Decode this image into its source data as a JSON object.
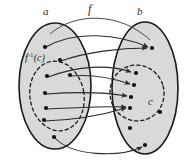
{
  "figure": {
    "type": "set-mapping-diagram",
    "background_color": "#ffffff",
    "set_fill_color": "#d9d9d9",
    "set_stroke_color": "#1a1a1a",
    "dashed_stroke_color": "#1a1a1a",
    "arrow_color": "#2b2b2b",
    "dot_color": "#111111"
  },
  "labels": {
    "domain_set": "a",
    "codomain_set": "b",
    "function": "f",
    "subset": "c",
    "preimage_base": "f",
    "preimage_exponent": "-1",
    "preimage_arg": "(c)"
  },
  "sets": {
    "domain": {
      "name": "a",
      "ellipse": {
        "cx": 55,
        "cy": 86,
        "rx": 36,
        "ry": 63
      },
      "inner_subset": {
        "name": "f^-1(c)",
        "dashed": true,
        "ellipse": {
          "cx": 57,
          "cy": 96,
          "rx": 27,
          "ry": 35,
          "rotate": -10
        }
      },
      "points": [
        {
          "id": "a1",
          "x": 45,
          "y": 47,
          "in_subset": false
        },
        {
          "id": "a2",
          "x": 60,
          "y": 60,
          "in_subset": false
        },
        {
          "id": "a3",
          "x": 47,
          "y": 76,
          "in_subset": true
        },
        {
          "id": "a4",
          "x": 70,
          "y": 75,
          "in_subset": true
        },
        {
          "id": "a5",
          "x": 45,
          "y": 93,
          "in_subset": true
        },
        {
          "id": "a6",
          "x": 46,
          "y": 108,
          "in_subset": true
        },
        {
          "id": "a7",
          "x": 44,
          "y": 120,
          "in_subset": true
        },
        {
          "id": "a8",
          "x": 54,
          "y": 137,
          "in_subset": false
        }
      ]
    },
    "codomain": {
      "name": "b",
      "ellipse": {
        "cx": 145,
        "cy": 88,
        "rx": 33,
        "ry": 66
      },
      "inner_subset": {
        "name": "c",
        "dashed": true,
        "ellipse": {
          "cx": 137,
          "cy": 93,
          "rx": 27,
          "ry": 28,
          "rotate": -15
        }
      },
      "points": [
        {
          "id": "b1",
          "x": 152,
          "y": 48,
          "in_subset": false
        },
        {
          "id": "b2",
          "x": 136,
          "y": 73,
          "in_subset": true
        },
        {
          "id": "b3",
          "x": 134,
          "y": 85,
          "in_subset": true
        },
        {
          "id": "b4",
          "x": 131,
          "y": 97,
          "in_subset": true
        },
        {
          "id": "b5",
          "x": 130,
          "y": 108,
          "in_subset": true
        },
        {
          "id": "b6",
          "x": 160,
          "y": 112,
          "in_subset": false
        },
        {
          "id": "b7",
          "x": 130,
          "y": 128,
          "in_subset": false
        },
        {
          "id": "b8",
          "x": 145,
          "y": 145,
          "in_subset": false
        }
      ]
    }
  },
  "mappings": [
    {
      "from": "a1",
      "to": "b1",
      "label": "f"
    },
    {
      "from": "a2",
      "to": "b1",
      "label": "f"
    },
    {
      "from": "a3",
      "to": "b2",
      "label": "f"
    },
    {
      "from": "a4",
      "to": "b3",
      "label": "f"
    },
    {
      "from": "a5",
      "to": "b4",
      "label": "f"
    },
    {
      "from": "a6",
      "to": "b5",
      "label": "f"
    },
    {
      "from": "a7",
      "to": "b5",
      "label": "f"
    },
    {
      "from": "a8",
      "to": "b8",
      "label": "f"
    }
  ]
}
